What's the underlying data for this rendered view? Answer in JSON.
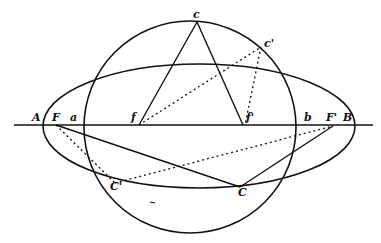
{
  "diagram": {
    "labels": {
      "A": "A",
      "F": "F",
      "a": "a",
      "f": "f",
      "f2": "f'",
      "b": "b",
      "F2": "F'",
      "B": "B",
      "c": "c",
      "c2": "c'",
      "C": "C",
      "C2": "C'"
    },
    "colors": {
      "stroke": "#111111",
      "background": "#ffffff"
    }
  }
}
